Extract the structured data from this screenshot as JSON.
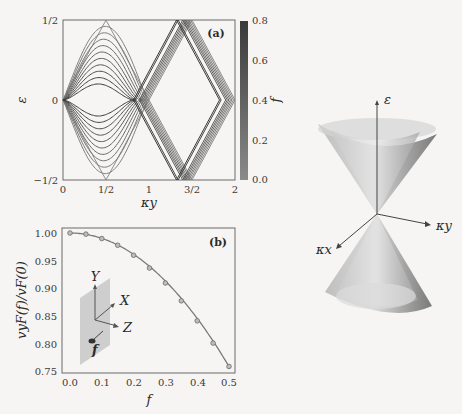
{
  "figure": {
    "panel_a": {
      "label": "(a)",
      "xlabel": "κy",
      "ylabel": "ε",
      "xticks": [
        "0",
        "1/2",
        "1",
        "3/2",
        "2"
      ],
      "yticks": [
        "1/2",
        "0",
        "−1/2"
      ],
      "colorbar": {
        "label": "f",
        "ticks": [
          "0.8",
          "0.6",
          "0.4",
          "0.2",
          "0.0"
        ],
        "color_low": "#8a8a8a",
        "color_high": "#3a3a3a"
      }
    },
    "panel_b": {
      "label": "(b)",
      "xlabel": "f",
      "ylabel": "vyF(f)/vF(0)",
      "xticks": [
        "0.0",
        "0.1",
        "0.2",
        "0.3",
        "0.4",
        "0.5"
      ],
      "yticks": [
        "1.00",
        "0.95",
        "0.90",
        "0.85",
        "0.80",
        "0.75"
      ],
      "inset_axes": {
        "y": "Y",
        "x": "X",
        "z": "Z",
        "f": "f"
      }
    },
    "cone": {
      "axis_energy": "ε",
      "axis_kx": "κx",
      "axis_ky": "κy"
    }
  },
  "chart_data": [
    {
      "type": "line",
      "title": "(a)",
      "xlabel": "κy",
      "ylabel": "ε",
      "xlim": [
        0,
        2
      ],
      "ylim": [
        -0.5,
        0.5
      ],
      "description": "Band structure lines for various f (colorbar 0.0–0.8); bands peak near ±1/2 at κy=1/2 and ±1/2 at κy=3/2, crossings near κy≈1 and κy=2.",
      "series_param_f": [
        0.0,
        0.08,
        0.16,
        0.24,
        0.32,
        0.4,
        0.48,
        0.56,
        0.64,
        0.72,
        0.8
      ],
      "peak_at_half": [
        0.5,
        0.46,
        0.42,
        0.38,
        0.34,
        0.3,
        0.26,
        0.22,
        0.18,
        0.14,
        0.1
      ],
      "colorbar_label": "f",
      "colorbar_range": [
        0.0,
        0.8
      ]
    },
    {
      "type": "line",
      "title": "(b)",
      "xlabel": "f",
      "ylabel": "vyF(f)/vF(0)",
      "xlim": [
        0,
        0.5
      ],
      "ylim": [
        0.75,
        1.0
      ],
      "x": [
        0.0,
        0.05,
        0.1,
        0.15,
        0.2,
        0.25,
        0.3,
        0.35,
        0.4,
        0.45,
        0.5
      ],
      "series": [
        {
          "name": "markers",
          "values": [
            1.0,
            0.998,
            0.99,
            0.978,
            0.96,
            0.937,
            0.91,
            0.878,
            0.842,
            0.802,
            0.76
          ]
        }
      ]
    }
  ]
}
